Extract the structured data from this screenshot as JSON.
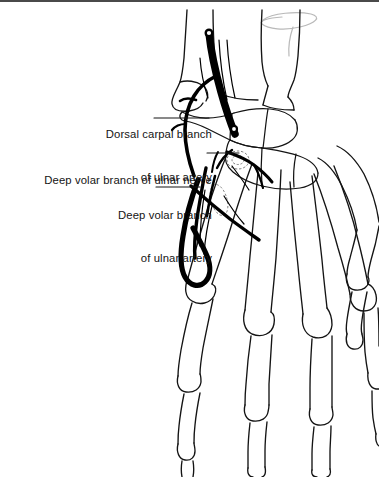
{
  "figure": {
    "type": "anatomical-line-drawing",
    "view": "dorsal view of right hand skeleton with volar vasculature",
    "background_color": "#ffffff",
    "line_color": "#141414",
    "vessel_color": "#000000",
    "rule_color": "#4a4a4a"
  },
  "labels": [
    {
      "id": "dorsal-carpal-branch",
      "line1": "Dorsal carpal branch",
      "line2": "of ulnar artery",
      "leader": "horizontal line from label to dorsal carpal vessel at wrist"
    },
    {
      "id": "deep-volar-branch-nerve",
      "line1": "Deep volar branch of ulnar nerve",
      "line2": "",
      "leader": "horizontal line from label to deep motor branch at hamate"
    },
    {
      "id": "deep-volar-branch-artery",
      "line1": "Deep volar branch",
      "line2": "of ulnar artery",
      "leader": "horizontal line from label to deep palmar arch vessel"
    }
  ],
  "structures": [
    {
      "name": "ulna",
      "region": "forearm"
    },
    {
      "name": "radius",
      "region": "forearm"
    },
    {
      "name": "carpal-bones",
      "region": "wrist"
    },
    {
      "name": "metacarpals",
      "region": "palm",
      "count": 5
    },
    {
      "name": "proximal-phalanges",
      "region": "fingers",
      "count": 5
    },
    {
      "name": "middle-phalanges",
      "region": "fingers",
      "count": 4
    },
    {
      "name": "distal-phalanges",
      "region": "fingers",
      "count": 5
    },
    {
      "name": "ulnar-artery",
      "region": "wrist-to-palm"
    },
    {
      "name": "deep-palmar-arch",
      "region": "palm"
    },
    {
      "name": "ulnar-nerve-deep-branch",
      "region": "palm"
    }
  ],
  "marks": [
    {
      "name": "grey-scribble-mark",
      "description": "faint hand-drawn grey ellipse and stroke near top right"
    }
  ]
}
